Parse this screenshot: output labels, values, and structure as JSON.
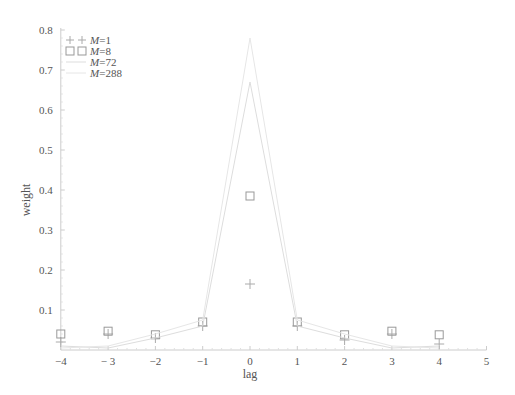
{
  "chart_data": {
    "type": "line",
    "title": "",
    "xlabel": "lag",
    "ylabel": "weight",
    "xlim": [
      -4,
      5
    ],
    "ylim": [
      0,
      0.8
    ],
    "x_ticks": [
      -4,
      -3,
      -2,
      -1,
      0,
      1,
      2,
      3,
      4,
      5
    ],
    "x_tick_labels": [
      "−4",
      "− 3",
      "−2",
      "−1",
      "0",
      "1",
      "2",
      "3",
      "4",
      "5"
    ],
    "y_ticks": [
      0.1,
      0.2,
      0.3,
      0.4,
      0.5,
      0.6,
      0.7,
      0.8
    ],
    "y_tick_labels": [
      "0.1",
      "0.2",
      "0.3",
      "0.4",
      "0.5",
      "0.6",
      "0.7",
      "0.8"
    ],
    "grid": false,
    "legend_position": "upper-left",
    "x": [
      -4,
      -3,
      -2,
      -1,
      0,
      1,
      2,
      3,
      4
    ],
    "series": [
      {
        "name": "M=1",
        "label_prefix": "M",
        "label_suffix": "=1",
        "style": "cross-marker",
        "color": "#aaaaaa",
        "values": [
          0.02,
          0.04,
          0.03,
          0.06,
          0.165,
          0.06,
          0.025,
          0.04,
          0.015
        ]
      },
      {
        "name": "M=8",
        "label_prefix": "M",
        "label_suffix": "=8",
        "style": "square-marker",
        "color": "#999999",
        "values": [
          0.04,
          0.047,
          0.038,
          0.07,
          0.385,
          0.07,
          0.038,
          0.047,
          0.038
        ]
      },
      {
        "name": "M=72",
        "label_prefix": "M",
        "label_suffix": "=72",
        "style": "line",
        "color": "#dddddd",
        "values": [
          0.01,
          0.005,
          0.03,
          0.06,
          0.67,
          0.06,
          0.03,
          0.005,
          0.01
        ]
      },
      {
        "name": "M=288",
        "label_prefix": "M",
        "label_suffix": "=288",
        "style": "line",
        "color": "#e6e6e6",
        "values": [
          0.005,
          0.01,
          0.04,
          0.075,
          0.78,
          0.075,
          0.04,
          0.01,
          0.005
        ]
      }
    ]
  }
}
